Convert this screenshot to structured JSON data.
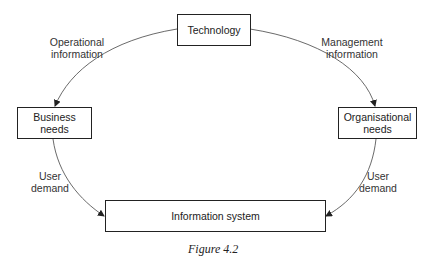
{
  "diagram": {
    "nodes": {
      "technology": "Technology",
      "business_needs": "Business\nneeds",
      "organisational_needs": "Organisational\nneeds",
      "information_system": "Information system"
    },
    "edges": {
      "operational_information": "Operational\ninformation",
      "management_information": "Management\ninformation",
      "user_demand_left": "User\ndemand",
      "user_demand_right": "User\ndemand"
    },
    "edge_list": [
      {
        "from": "Technology",
        "to": "Business needs",
        "label": "Operational information"
      },
      {
        "from": "Technology",
        "to": "Organisational needs",
        "label": "Management information"
      },
      {
        "from": "Business needs",
        "to": "Information system",
        "label": "User demand"
      },
      {
        "from": "Organisational needs",
        "to": "Information system",
        "label": "User demand"
      }
    ],
    "caption": "Figure 4.2"
  }
}
